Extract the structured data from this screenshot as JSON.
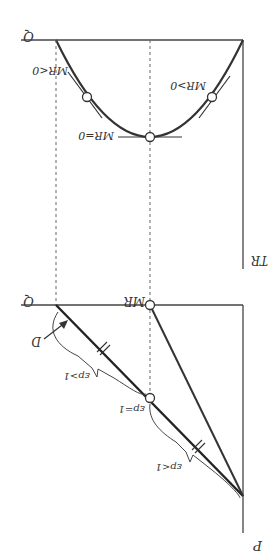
{
  "figure": {
    "orientation": "rotated-180",
    "colors": {
      "line": "#333333",
      "axis": "#444444",
      "dash": "#666666",
      "background": "#ffffff"
    }
  },
  "top_panel": {
    "y_axis_label": "TR",
    "x_axis_label": "Q",
    "curve": "TR (inverted parabola)",
    "points": [
      {
        "label": "MR>0"
      },
      {
        "label": "MR=0"
      },
      {
        "label": "MR<0"
      }
    ]
  },
  "bottom_panel": {
    "y_axis_label": "P",
    "x_axis_label": "Q",
    "mr_label": "MR",
    "demand_label": "D",
    "elasticity": [
      {
        "label": "εp>1"
      },
      {
        "label": "εp=1"
      },
      {
        "label": "εp<1"
      }
    ]
  }
}
